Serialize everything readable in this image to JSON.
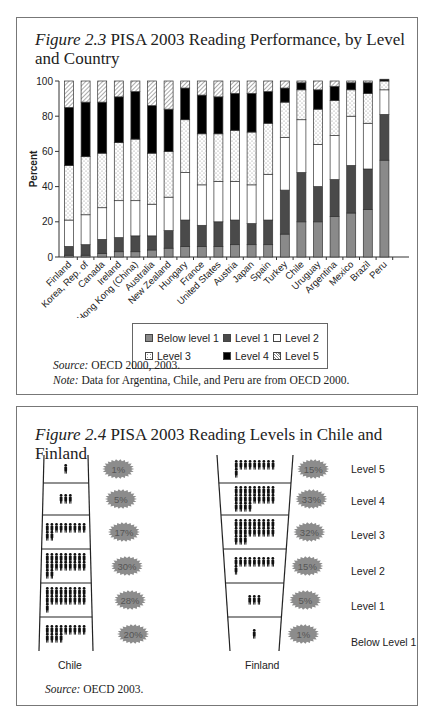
{
  "figure1": {
    "title_italic": "Figure 2.3",
    "title_rest": " PISA 2003 Reading Performance, by Level and Country",
    "source_label": "Source:",
    "source_text": " OECD 2000, 2003.",
    "note_label": "Note:",
    "note_text": " Data for Argentina, Chile, and Peru are from OECD 2000.",
    "legend": [
      {
        "key": "bl1",
        "label": "Below level 1"
      },
      {
        "key": "l1",
        "label": "Level 1"
      },
      {
        "key": "l2",
        "label": "Level 2"
      },
      {
        "key": "l3",
        "label": "Level 3"
      },
      {
        "key": "l4",
        "label": "Level 4"
      },
      {
        "key": "l5",
        "label": "Level 5"
      }
    ]
  },
  "figure2": {
    "title_italic": "Figure 2.4",
    "title_rest": " PISA 2003 Reading Levels in Chile and Finland",
    "chile_label": "Chile",
    "finland_label": "Finland",
    "source_label": "Source:",
    "source_text": " OECD 2003.",
    "level_labels": [
      "Level 5",
      "Level 4",
      "Level 3",
      "Level 2",
      "Level 1",
      "Below Level 1"
    ],
    "chile_pcts": [
      "1%",
      "5%",
      "17%",
      "30%",
      "28%",
      "20%"
    ],
    "finland_pcts": [
      "15%",
      "33%",
      "32%",
      "15%",
      "5%",
      "1%"
    ]
  },
  "chart_data": [
    {
      "type": "bar",
      "stacked": true,
      "title": "Figure 2.3 PISA 2003 Reading Performance, by Level and Country",
      "xlabel": "",
      "ylabel": "Percent",
      "ylim": [
        0,
        100
      ],
      "yticks": [
        0,
        20,
        40,
        60,
        80,
        100
      ],
      "legend_position": "bottom",
      "categories": [
        "Finland",
        "Korea, Rep. of",
        "Canada",
        "Ireland",
        "Hong Kong (China)",
        "Australia",
        "New Zealand",
        "Hungary",
        "France",
        "United States",
        "Austria",
        "Japan",
        "Spain",
        "Turkey",
        "Chile",
        "Uruguay",
        "Argentina",
        "Mexico",
        "Brazil",
        "Peru"
      ],
      "series": [
        {
          "name": "Below level 1",
          "values": [
            1,
            1,
            2,
            3,
            3,
            4,
            5,
            6,
            6,
            6,
            7,
            7,
            7,
            13,
            20,
            20,
            23,
            25,
            27,
            55
          ]
        },
        {
          "name": "Level 1",
          "values": [
            5,
            6,
            8,
            8,
            9,
            8,
            10,
            15,
            12,
            14,
            14,
            12,
            14,
            25,
            28,
            20,
            21,
            27,
            23,
            26
          ]
        },
        {
          "name": "Level 2",
          "values": [
            15,
            17,
            18,
            21,
            20,
            18,
            19,
            27,
            23,
            23,
            22,
            22,
            26,
            30,
            30,
            24,
            25,
            28,
            26,
            14
          ]
        },
        {
          "name": "Level 3",
          "values": [
            31,
            33,
            31,
            33,
            35,
            29,
            26,
            30,
            29,
            27,
            29,
            30,
            29,
            20,
            17,
            20,
            20,
            15,
            17,
            5
          ]
        },
        {
          "name": "Level 4",
          "values": [
            33,
            31,
            29,
            26,
            27,
            27,
            24,
            18,
            22,
            21,
            21,
            22,
            18,
            8,
            4,
            11,
            8,
            4,
            6,
            1
          ]
        },
        {
          "name": "Level 5",
          "values": [
            15,
            12,
            12,
            9,
            6,
            14,
            16,
            4,
            8,
            9,
            7,
            7,
            6,
            4,
            1,
            5,
            3,
            1,
            1,
            0
          ]
        }
      ]
    },
    {
      "type": "pictogram",
      "title": "Figure 2.4 PISA 2003 Reading Levels in Chile and Finland",
      "categories": [
        "Level 5",
        "Level 4",
        "Level 3",
        "Level 2",
        "Level 1",
        "Below Level 1"
      ],
      "series": [
        {
          "name": "Chile",
          "values": [
            1,
            5,
            17,
            30,
            28,
            20
          ]
        },
        {
          "name": "Finland",
          "values": [
            15,
            33,
            32,
            15,
            5,
            1
          ]
        }
      ]
    }
  ]
}
